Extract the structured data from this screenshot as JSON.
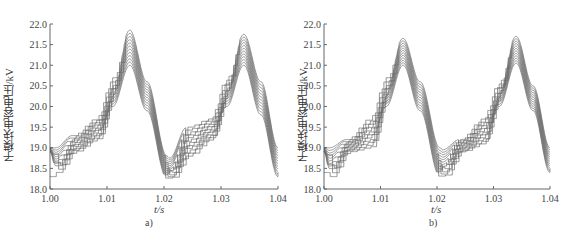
{
  "chart_data": [
    {
      "panel": "a)",
      "type": "line",
      "title": "",
      "xlabel": "t/s",
      "ylabel": "子模块电容电压/kV",
      "xlim": [
        1.0,
        1.04
      ],
      "ylim": [
        18.0,
        22.0
      ],
      "x_ticks": [
        "1.00",
        "1.01",
        "1.02",
        "1.03",
        "1.04"
      ],
      "y_ticks": [
        "18.0",
        "18.5",
        "19.0",
        "19.5",
        "20.0",
        "20.5",
        "21.0",
        "21.5",
        "22.0"
      ],
      "grid": false,
      "legend": null,
      "description": "Many overlapping submodule capacitor voltage traces with staircase charging segments; peaks near t=1.014 s and t=1.034 s, troughs near t=1.001 s and t=1.021 s",
      "envelope": {
        "x": [
          1.0,
          1.001,
          1.004,
          1.008,
          1.011,
          1.014,
          1.017,
          1.0205,
          1.021,
          1.024,
          1.028,
          1.031,
          1.034,
          1.037,
          1.04
        ],
        "upper": [
          19.0,
          19.0,
          19.3,
          19.7,
          20.7,
          21.85,
          20.6,
          18.8,
          18.75,
          19.5,
          19.7,
          20.7,
          21.75,
          20.6,
          19.0
        ],
        "lower": [
          18.9,
          18.4,
          18.9,
          19.2,
          20.0,
          21.0,
          19.9,
          18.25,
          18.25,
          18.8,
          19.2,
          20.0,
          21.0,
          19.8,
          18.3
        ]
      },
      "series_count_estimate": 12
    },
    {
      "panel": "b)",
      "type": "line",
      "title": "",
      "xlabel": "t/s",
      "ylabel": "子模块电容电压/kV",
      "xlim": [
        1.0,
        1.04
      ],
      "ylim": [
        18.0,
        22.0
      ],
      "x_ticks": [
        "1.00",
        "1.01",
        "1.02",
        "1.03",
        "1.04"
      ],
      "y_ticks": [
        "18.0",
        "18.5",
        "19.0",
        "19.5",
        "20.0",
        "20.5",
        "21.0",
        "21.5",
        "22.0"
      ],
      "grid": false,
      "legend": null,
      "description": "Many overlapping submodule capacitor voltage traces with staircase segments, tighter peak spread than a); peaks near t=1.014 s and t=1.034 s",
      "envelope": {
        "x": [
          1.0,
          1.001,
          1.004,
          1.008,
          1.011,
          1.014,
          1.017,
          1.0205,
          1.021,
          1.024,
          1.028,
          1.031,
          1.034,
          1.037,
          1.04
        ],
        "upper": [
          19.0,
          19.0,
          19.2,
          19.7,
          20.7,
          21.65,
          20.6,
          19.0,
          18.95,
          19.2,
          19.7,
          20.6,
          21.7,
          20.5,
          19.0
        ],
        "lower": [
          18.9,
          18.3,
          18.9,
          19.0,
          20.0,
          21.0,
          19.9,
          18.3,
          18.3,
          18.9,
          19.1,
          20.0,
          21.05,
          19.9,
          18.4
        ]
      },
      "series_count_estimate": 12
    }
  ],
  "panels": [
    {
      "id": "a",
      "sublabel": "a)",
      "xlabel": "t/s",
      "ylabel": "子模块电容电压/kV"
    },
    {
      "id": "b",
      "sublabel": "b)",
      "xlabel": "t/s",
      "ylabel": "子模块电容电压/kV"
    }
  ],
  "colors": {
    "trace": "#3a3a3a",
    "axis": "#666666",
    "background": "#ffffff"
  }
}
